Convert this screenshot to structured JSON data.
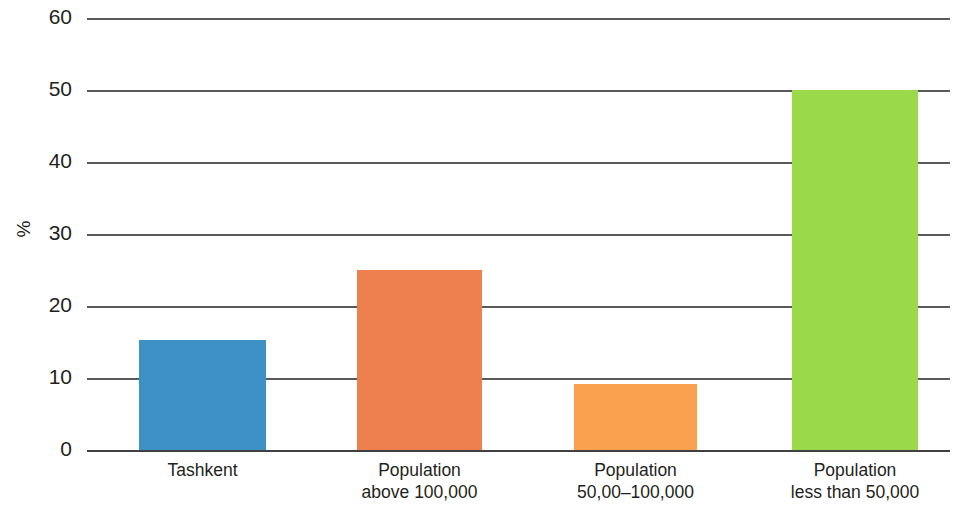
{
  "chart_data": {
    "type": "bar",
    "title": "",
    "subtitle": "",
    "xlabel": "",
    "ylabel": "%",
    "ylim": [
      0,
      60
    ],
    "ytick_values": [
      0,
      10,
      20,
      30,
      40,
      50,
      60
    ],
    "ytick_labels": [
      "0",
      "10",
      "20",
      "30",
      "40",
      "50",
      "60"
    ],
    "grid": true,
    "grid_axis": "y",
    "legend": false,
    "legend_position": "none",
    "categories": [
      "Tashkent",
      "Population above 100,000",
      "Population 50,00–100,000",
      "Population less than 50,000"
    ],
    "category_lines": [
      [
        "Tashkent"
      ],
      [
        "Population",
        "above 100,000"
      ],
      [
        "Population",
        "50,00–100,000"
      ],
      [
        "Population",
        "less than 50,000"
      ]
    ],
    "values": [
      15.3,
      25,
      9.2,
      50
    ],
    "colors": [
      "#3d91c4",
      "#ee7f4f",
      "#f9a14e",
      "#9ad94a"
    ],
    "bar_color_names": [
      "blue",
      "orange",
      "light-orange",
      "green"
    ],
    "background": "#ffffff",
    "axis_color": "#58595b",
    "text_color": "#231f20"
  },
  "bars": [
    {
      "label": "Tashkent",
      "line1": "Tashkent",
      "line2": "",
      "value": 15.3,
      "color": "#3d91c4",
      "left": 139,
      "width": 127
    },
    {
      "label": "Population above 100,000",
      "line1": "Population",
      "line2": "above 100,000",
      "value": 25,
      "color": "#ee7f4f",
      "left": 357,
      "width": 125
    },
    {
      "label": "Population 50,00–100,000",
      "line1": "Population",
      "line2": "50,00–100,000",
      "value": 9.2,
      "color": "#f9a14e",
      "left": 574,
      "width": 123
    },
    {
      "label": "Population less than 50,000",
      "line1": "Population",
      "line2": "less than 50,000",
      "value": 50,
      "color": "#9ad94a",
      "left": 792,
      "width": 126
    }
  ],
  "yaxis": {
    "label": "%",
    "ticks": [
      {
        "label": "60",
        "value": 60
      },
      {
        "label": "50",
        "value": 50
      },
      {
        "label": "40",
        "value": 40
      },
      {
        "label": "30",
        "value": 30
      },
      {
        "label": "20",
        "value": 20
      },
      {
        "label": "10",
        "value": 10
      },
      {
        "label": "0",
        "value": 0
      }
    ]
  }
}
